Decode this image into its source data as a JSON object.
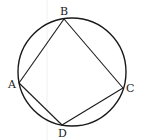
{
  "diagram": {
    "circle": {
      "cx": 72,
      "cy": 72,
      "r": 54
    },
    "stroke_color": "#1a1a1a",
    "points": [
      {
        "name": "A",
        "x": 19,
        "y": 83,
        "label_x": 8,
        "label_y": 88
      },
      {
        "name": "B",
        "x": 64,
        "y": 19,
        "label_x": 60,
        "label_y": 15
      },
      {
        "name": "C",
        "x": 123,
        "y": 88,
        "label_x": 126,
        "label_y": 92
      },
      {
        "name": "D",
        "x": 62,
        "y": 125,
        "label_x": 58,
        "label_y": 137
      }
    ],
    "segments": [
      [
        "A",
        "B"
      ],
      [
        "B",
        "C"
      ],
      [
        "C",
        "D"
      ],
      [
        "D",
        "A"
      ]
    ]
  }
}
